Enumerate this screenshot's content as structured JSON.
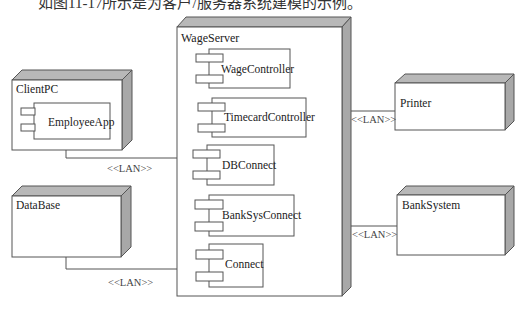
{
  "caption": "如图11-17所示是为客户/服务器系统建模的示例。",
  "nodes": {
    "client": {
      "name": "ClientPC",
      "components": [
        "EmployeeApp"
      ]
    },
    "database": {
      "name": "DataBase"
    },
    "server": {
      "name": "WageServer",
      "components": [
        "WageController",
        "TimecardController",
        "DBConnect",
        "BankSysConnect",
        "Connect"
      ]
    },
    "printer": {
      "name": "Printer"
    },
    "bank": {
      "name": "BankSystem"
    }
  },
  "connections": [
    {
      "from": "ClientPC",
      "to": "WageServer",
      "label": "<<LAN>>"
    },
    {
      "from": "DataBase",
      "to": "WageServer",
      "label": "<<LAN>>"
    },
    {
      "from": "WageServer",
      "to": "Printer",
      "label": "<<LAN>>"
    },
    {
      "from": "WageServer",
      "to": "BankSystem",
      "label": "<<LAN>>"
    }
  ],
  "colors": {
    "line": "#555555",
    "shade": "#a8a8a8",
    "top": "#b8b8b8"
  }
}
